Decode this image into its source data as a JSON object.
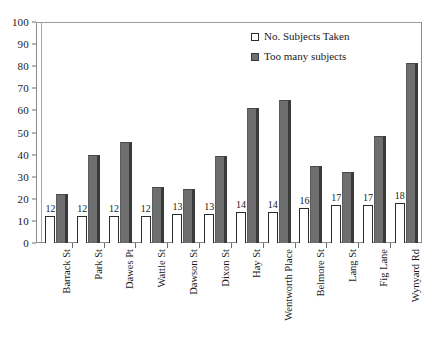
{
  "chart_data": {
    "type": "bar",
    "title": "",
    "subtitle": "",
    "xlabel": "",
    "ylabel": "",
    "ylim": [
      0,
      100
    ],
    "y_ticks": [
      0,
      10,
      20,
      30,
      40,
      50,
      60,
      70,
      80,
      90,
      100
    ],
    "grid": false,
    "legend_position": "top-right",
    "categories": [
      "Barrack St",
      "Park St",
      "Dawes Pt",
      "Wattle St",
      "Dawson St",
      "Dixon St",
      "Hay St",
      "Wentworth Place",
      "Belmore St",
      "Lang St",
      "Fig Lane",
      "Wynyard Rd"
    ],
    "series": [
      {
        "name": "No. Subjects Taken",
        "values": [
          12,
          12,
          12,
          12,
          13,
          13,
          14,
          14,
          16,
          17,
          17,
          18
        ],
        "data_labels": [
          "12",
          "12",
          "12",
          "12",
          "13",
          "13",
          "14",
          "14",
          "16",
          "17",
          "17",
          "18"
        ],
        "color": "#ffffff",
        "border_color": "#2b2b2b"
      },
      {
        "name": "Too many subjects",
        "values": [
          22,
          40,
          45.5,
          25.5,
          24.5,
          39.5,
          61,
          64.5,
          35,
          32,
          48.5,
          81.5
        ],
        "data_labels": [
          "",
          "",
          "",
          "",
          "",
          "",
          "",
          "",
          "",
          "",
          "",
          ""
        ],
        "color": "#6e6e6e",
        "border_color": "#3a3a3a"
      }
    ]
  },
  "legend": {
    "items": [
      {
        "label": "No. Subjects Taken",
        "swatch": "empty-square-icon"
      },
      {
        "label": "Too many subjects",
        "swatch": "filled-square-icon"
      }
    ]
  },
  "axis": {
    "y_tick_labels": [
      "100",
      "90",
      "80",
      "70",
      "60",
      "50",
      "40",
      "30",
      "20",
      "10",
      "0"
    ]
  }
}
